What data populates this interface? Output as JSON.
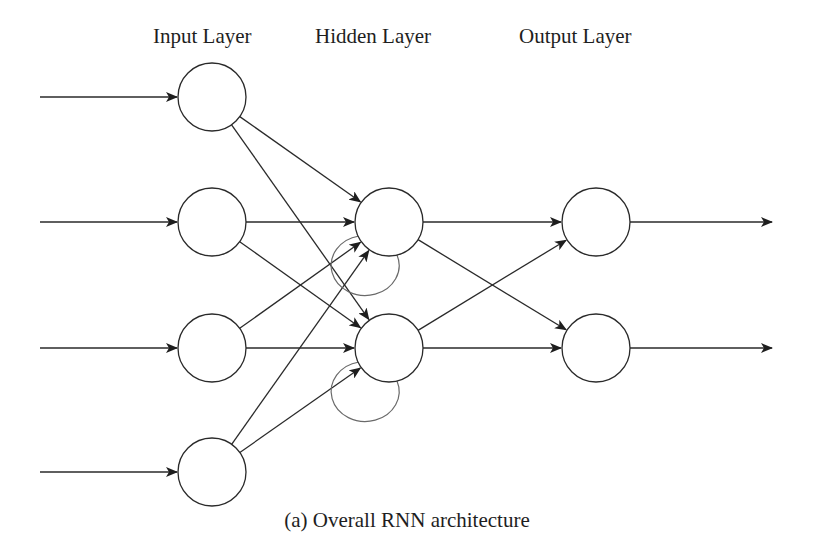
{
  "labels": {
    "input_layer": "Input Layer",
    "hidden_layer": "Hidden Layer",
    "output_layer": "Output Layer"
  },
  "caption": "(a) Overall RNN architecture",
  "colors": {
    "stroke": "#2a2a2a",
    "recurrent_stroke": "#6a6a6a",
    "background": "#ffffff"
  },
  "network": {
    "node_radius": 34,
    "input_nodes": [
      {
        "id": "i1",
        "x": 212,
        "y": 97
      },
      {
        "id": "i2",
        "x": 212,
        "y": 222
      },
      {
        "id": "i3",
        "x": 212,
        "y": 348
      },
      {
        "id": "i4",
        "x": 212,
        "y": 472
      }
    ],
    "hidden_nodes": [
      {
        "id": "h1",
        "x": 389,
        "y": 222
      },
      {
        "id": "h2",
        "x": 389,
        "y": 348
      }
    ],
    "output_nodes": [
      {
        "id": "o1",
        "x": 596,
        "y": 222
      },
      {
        "id": "o2",
        "x": 596,
        "y": 348
      }
    ],
    "external_inputs": [
      {
        "to": "i1",
        "x_start": 40
      },
      {
        "to": "i2",
        "x_start": 40
      },
      {
        "to": "i3",
        "x_start": 40
      },
      {
        "to": "i4",
        "x_start": 40
      }
    ],
    "external_outputs": [
      {
        "from": "o1",
        "x_end": 772
      },
      {
        "from": "o2",
        "x_end": 772
      }
    ],
    "recurrent_loops": [
      "h1",
      "h2"
    ]
  }
}
